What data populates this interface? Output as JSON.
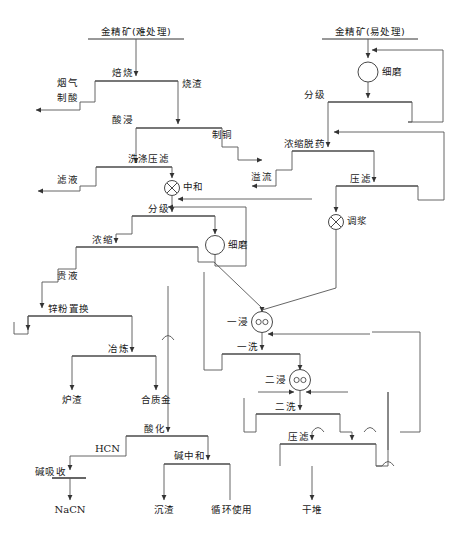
{
  "diagram": {
    "type": "process-flow",
    "width": 474,
    "height": 557,
    "colors": {
      "line": "#555555",
      "text": "#1a1a1a",
      "background": "#ffffff",
      "box_top_rule": "#777777"
    },
    "inputs": [
      {
        "id": "feed_refractory",
        "label": "金精矿(难处理)"
      },
      {
        "id": "feed_free_milling",
        "label": "金精矿(易处理)"
      }
    ],
    "operations": [
      {
        "id": "roasting",
        "label": "焙烧",
        "shape": "arrow-label"
      },
      {
        "id": "acid_leach",
        "label": "酸浸",
        "shape": "arrow-label"
      },
      {
        "id": "wash_filter",
        "label": "洗涤压滤",
        "shape": "arrow-label"
      },
      {
        "id": "neutralize",
        "label": "中和",
        "shape": "circle-cross"
      },
      {
        "id": "classify_left",
        "label": "分级",
        "shape": "arrow-label"
      },
      {
        "id": "fine_grind_mid",
        "label": "细磨",
        "shape": "circle"
      },
      {
        "id": "thicken",
        "label": "浓缩",
        "shape": "arrow-label"
      },
      {
        "id": "zinc_cement",
        "label": "锌粉置换",
        "shape": "arrow-label"
      },
      {
        "id": "smelting",
        "label": "冶炼",
        "shape": "arrow-label"
      },
      {
        "id": "acidify",
        "label": "酸化",
        "shape": "arrow-label"
      },
      {
        "id": "alkali_absorb",
        "label": "碱吸收",
        "shape": "arrow-label"
      },
      {
        "id": "alkali_neutral",
        "label": "碱中和",
        "shape": "arrow-label"
      },
      {
        "id": "fine_grind_right",
        "label": "细磨",
        "shape": "circle"
      },
      {
        "id": "classify_right",
        "label": "分级",
        "shape": "arrow-label"
      },
      {
        "id": "thicken_strip",
        "label": "浓缩脱药",
        "shape": "arrow-label"
      },
      {
        "id": "press_filter_1",
        "label": "压滤",
        "shape": "arrow-label"
      },
      {
        "id": "slurry_mix",
        "label": "调浆",
        "shape": "circle-cross"
      },
      {
        "id": "leach_1",
        "label": "一浸",
        "shape": "circle-double"
      },
      {
        "id": "wash_1",
        "label": "一洗",
        "shape": "arrow-label"
      },
      {
        "id": "leach_2",
        "label": "二浸",
        "shape": "circle-double"
      },
      {
        "id": "wash_2",
        "label": "二洗",
        "shape": "arrow-label"
      },
      {
        "id": "press_filter_2",
        "label": "压滤",
        "shape": "arrow-label"
      }
    ],
    "streams": [
      {
        "id": "flue_gas",
        "label": "烟气"
      },
      {
        "id": "acid_making",
        "label": "制酸"
      },
      {
        "id": "calcine",
        "label": "烧渣"
      },
      {
        "id": "copper_make",
        "label": "制铜"
      },
      {
        "id": "filtrate",
        "label": "滤液"
      },
      {
        "id": "pregnant",
        "label": "贵液"
      },
      {
        "id": "overflow",
        "label": "溢流"
      },
      {
        "id": "hcn",
        "label": "HCN"
      }
    ],
    "outputs": [
      {
        "id": "slag",
        "label": "炉渣"
      },
      {
        "id": "bullion",
        "label": "合质金"
      },
      {
        "id": "nacn",
        "label": "NaCN"
      },
      {
        "id": "precipitate",
        "label": "沉渣"
      },
      {
        "id": "recycle",
        "label": "循环使用"
      },
      {
        "id": "dry_stack",
        "label": "干堆"
      }
    ],
    "labels": {
      "feed_refractory": "金精矿(难处理)",
      "feed_free_milling": "金精矿(易处理)",
      "roasting": "焙烧",
      "flue_gas": "烟气",
      "acid_making": "制酸",
      "calcine": "烧渣",
      "acid_leach": "酸浸",
      "copper_make": "制铜",
      "wash_filter": "洗涤压滤",
      "filtrate": "滤液",
      "neutralize": "中和",
      "classify_left": "分级",
      "fine_grind_mid": "细磨",
      "thicken": "浓缩",
      "pregnant": "贵液",
      "zinc_cement": "锌粉置换",
      "smelting": "冶炼",
      "slag": "炉渣",
      "bullion": "合质金",
      "acidify": "酸化",
      "hcn": "HCN",
      "alkali_absorb": "碱吸收",
      "nacn": "NaCN",
      "alkali_neutral": "碱中和",
      "precipitate": "沉渣",
      "recycle": "循环使用",
      "fine_grind_right": "细磨",
      "classify_right": "分级",
      "thicken_strip": "浓缩脱药",
      "overflow": "溢流",
      "press_filter_1": "压滤",
      "slurry_mix": "调浆",
      "leach_1": "一浸",
      "wash_1": "一洗",
      "leach_2": "二浸",
      "wash_2": "二洗",
      "press_filter_2": "压滤",
      "dry_stack": "干堆"
    }
  }
}
